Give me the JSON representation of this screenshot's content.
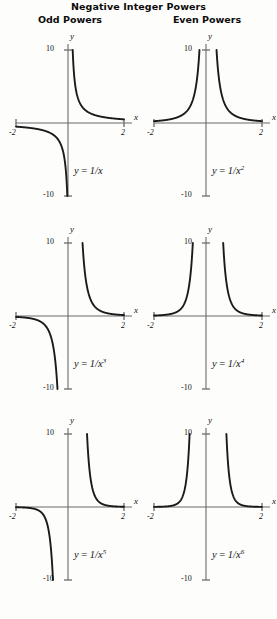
{
  "title": "Negative Integer Powers",
  "columns": [
    {
      "heading": "Odd Powers"
    },
    {
      "heading": "Even Powers"
    }
  ],
  "axes": {
    "x_label": "x",
    "y_label": "y",
    "x_min_label": "-2",
    "x_max_label": "2",
    "y_max_label": "10",
    "y_min_label": "-10"
  },
  "chart_data": [
    {
      "type": "line",
      "title": "y = 1/x",
      "equation_prefix": "y",
      "equation_op": " = ",
      "equation_body": "1/x",
      "exponent": "",
      "column": "Odd Powers",
      "row": 1,
      "xlabel": "x",
      "ylabel": "y",
      "xlim": [
        -2,
        2
      ],
      "ylim": [
        -10,
        10
      ],
      "grid": false,
      "legend": "none",
      "exponent_n": 1,
      "parity": "odd",
      "xticks": [
        -2,
        2
      ],
      "yticks": [
        -10,
        10
      ],
      "x": [
        -2,
        -1.75,
        -1.5,
        -1.25,
        -1,
        -0.75,
        -0.5,
        -0.4,
        -0.3,
        -0.2,
        -0.1,
        0.1,
        0.2,
        0.3,
        0.4,
        0.5,
        0.75,
        1,
        1.25,
        1.5,
        1.75,
        2
      ],
      "y": [
        -0.5,
        -0.571,
        -0.667,
        -0.8,
        -1,
        -1.333,
        -2,
        -2.5,
        -3.333,
        -5,
        -10,
        10,
        5,
        3.333,
        2.5,
        2,
        1.333,
        1,
        0.8,
        0.667,
        0.571,
        0.5
      ]
    },
    {
      "type": "line",
      "title": "y = 1/x^2",
      "equation_prefix": "y",
      "equation_op": " = ",
      "equation_body": "1/x",
      "exponent": "2",
      "column": "Even Powers",
      "row": 1,
      "xlabel": "x",
      "ylabel": "y",
      "xlim": [
        -2,
        2
      ],
      "ylim": [
        -10,
        10
      ],
      "grid": false,
      "legend": "none",
      "exponent_n": 2,
      "parity": "even",
      "xticks": [
        -2,
        2
      ],
      "yticks": [
        -10,
        10
      ],
      "x": [
        -2,
        -1.75,
        -1.5,
        -1.25,
        -1,
        -0.75,
        -0.5,
        -0.4,
        -0.35,
        -0.3163,
        0.3163,
        0.35,
        0.4,
        0.5,
        0.75,
        1,
        1.25,
        1.5,
        1.75,
        2
      ],
      "y": [
        0.25,
        0.327,
        0.444,
        0.64,
        1,
        1.778,
        4,
        6.25,
        8.163,
        10,
        10,
        8.163,
        6.25,
        4,
        1.778,
        1,
        0.64,
        0.444,
        0.327,
        0.25
      ]
    },
    {
      "type": "line",
      "title": "y = 1/x^3",
      "equation_prefix": "y",
      "equation_op": " = ",
      "equation_body": "1/x",
      "exponent": "3",
      "column": "Odd Powers",
      "row": 2,
      "xlabel": "x",
      "ylabel": "y",
      "xlim": [
        -2,
        2
      ],
      "ylim": [
        -10,
        10
      ],
      "grid": false,
      "legend": "none",
      "exponent_n": 3,
      "parity": "odd",
      "xticks": [
        -2,
        2
      ],
      "yticks": [
        -10,
        10
      ],
      "x": [
        -2,
        -1.75,
        -1.5,
        -1.25,
        -1,
        -0.75,
        -0.6,
        -0.5,
        -0.4642,
        0.4642,
        0.5,
        0.6,
        0.75,
        1,
        1.25,
        1.5,
        1.75,
        2
      ],
      "y": [
        -0.125,
        -0.187,
        -0.296,
        -0.512,
        -1,
        -2.37,
        -4.63,
        -8,
        -10,
        10,
        8,
        4.63,
        2.37,
        1,
        0.512,
        0.296,
        0.187,
        0.125
      ]
    },
    {
      "type": "line",
      "title": "y = 1/x^4",
      "equation_prefix": "y",
      "equation_op": " = ",
      "equation_body": "1/x",
      "exponent": "4",
      "column": "Even Powers",
      "row": 2,
      "xlabel": "x",
      "ylabel": "y",
      "xlim": [
        -2,
        2
      ],
      "ylim": [
        -10,
        10
      ],
      "grid": false,
      "legend": "none",
      "exponent_n": 4,
      "parity": "even",
      "xticks": [
        -2,
        2
      ],
      "yticks": [
        -10,
        10
      ],
      "x": [
        -2,
        -1.75,
        -1.5,
        -1.25,
        -1,
        -0.85,
        -0.75,
        -0.65,
        -0.5623,
        0.5623,
        0.65,
        0.75,
        0.85,
        1,
        1.25,
        1.5,
        1.75,
        2
      ],
      "y": [
        0.0625,
        0.107,
        0.198,
        0.41,
        1,
        1.916,
        3.16,
        5.6,
        10,
        10,
        5.6,
        3.16,
        1.916,
        1,
        0.41,
        0.198,
        0.107,
        0.0625
      ]
    },
    {
      "type": "line",
      "title": "y = 1/x^5",
      "equation_prefix": "y",
      "equation_op": " = ",
      "equation_body": "1/x",
      "exponent": "5",
      "column": "Odd Powers",
      "row": 3,
      "xlabel": "x",
      "ylabel": "y",
      "xlim": [
        -2,
        2
      ],
      "ylim": [
        -10,
        10
      ],
      "grid": false,
      "legend": "none",
      "exponent_n": 5,
      "parity": "odd",
      "xticks": [
        -2,
        2
      ],
      "yticks": [
        -10,
        10
      ],
      "x": [
        -2,
        -1.75,
        -1.5,
        -1.25,
        -1,
        -0.9,
        -0.8,
        -0.7,
        -0.631,
        0.631,
        0.7,
        0.8,
        0.9,
        1,
        1.25,
        1.5,
        1.75,
        2
      ],
      "y": [
        -0.031,
        -0.061,
        -0.132,
        -0.328,
        -1,
        -1.693,
        -3.052,
        -5.95,
        -10,
        10,
        5.95,
        3.052,
        1.693,
        1,
        0.328,
        0.132,
        0.061,
        0.031
      ]
    },
    {
      "type": "line",
      "title": "y = 1/x^6",
      "equation_prefix": "y",
      "equation_op": " = ",
      "equation_body": "1/x",
      "exponent": "6",
      "column": "Even Powers",
      "row": 3,
      "xlabel": "x",
      "ylabel": "y",
      "xlim": [
        -2,
        2
      ],
      "ylim": [
        -10,
        10
      ],
      "grid": false,
      "legend": "none",
      "exponent_n": 6,
      "parity": "even",
      "xticks": [
        -2,
        2
      ],
      "yticks": [
        -10,
        10
      ],
      "x": [
        -2,
        -1.75,
        -1.5,
        -1.25,
        -1,
        -0.9,
        -0.85,
        -0.8,
        -0.7,
        -0.681,
        0.681,
        0.7,
        0.8,
        0.85,
        0.9,
        1,
        1.25,
        1.5,
        1.75,
        2
      ],
      "y": [
        0.0156,
        0.0347,
        0.0878,
        0.262,
        1,
        1.881,
        2.689,
        3.815,
        8.5,
        10,
        10,
        8.5,
        3.815,
        2.689,
        1.881,
        1,
        0.262,
        0.0878,
        0.0347,
        0.0156
      ]
    }
  ],
  "style": {
    "curve_color": "#1b1b1b",
    "axis_color": "#6b6b6b",
    "text_color": "#111111",
    "background": "#fdfdfc"
  }
}
